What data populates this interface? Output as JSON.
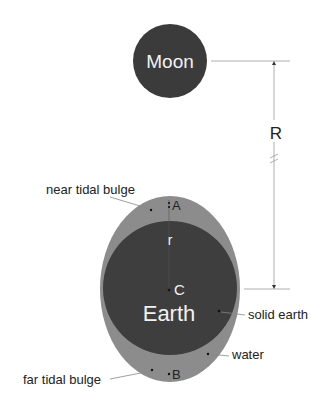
{
  "diagram": {
    "moon": {
      "label": "Moon",
      "color": "#3b3b3b"
    },
    "earth": {
      "label": "Earth",
      "solid_color": "#3e3e3e",
      "water_color": "#8c8c8c",
      "center_label": "C",
      "radius_label": "r"
    },
    "distance_label": "R",
    "points": {
      "near": "A",
      "far": "B"
    },
    "callouts": {
      "near_tidal_bulge": "near tidal bulge",
      "far_tidal_bulge": "far tidal bulge",
      "solid_earth": "solid earth",
      "water": "water"
    }
  }
}
